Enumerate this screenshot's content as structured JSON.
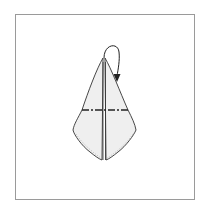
{
  "diagram": {
    "type": "origami-folding-step",
    "elements": [
      {
        "name": "paper-kite-shape",
        "description": "Folded paper model with central vertical crease, split at bottom"
      },
      {
        "name": "mountain-fold-line",
        "style": "dash-dot",
        "orientation": "horizontal"
      },
      {
        "name": "fold-arrow",
        "description": "Curved arrow over the top point, folding the tip behind/down"
      }
    ],
    "colors": {
      "paper_fill": "#efefef",
      "outline": "#333333",
      "fold_line": "#222222",
      "frame": "#9a9a9a",
      "background": "#ffffff"
    }
  }
}
